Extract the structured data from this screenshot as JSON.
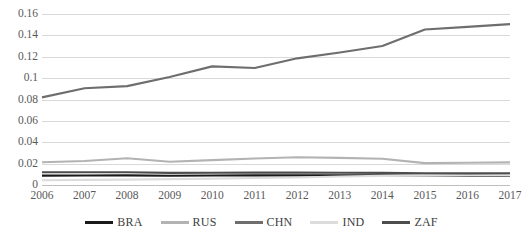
{
  "chart_data": {
    "type": "line",
    "title": "",
    "xlabel": "",
    "ylabel": "",
    "grid": true,
    "legend_position": "bottom",
    "categories": [
      2006,
      2007,
      2008,
      2009,
      2010,
      2011,
      2012,
      2013,
      2014,
      2015,
      2016,
      2017
    ],
    "x_tick_labels": [
      "2006",
      "2007",
      "2008",
      "2009",
      "2010",
      "2011",
      "2012",
      "2013",
      "2014",
      "2015",
      "2016",
      "2017"
    ],
    "y_tick_labels": [
      "0",
      "0.02",
      "0.04",
      "0.06",
      "0.08",
      "0.1",
      "0.12",
      "0.14",
      "0.16"
    ],
    "y_ticks": [
      0,
      0.02,
      0.04,
      0.06,
      0.08,
      0.1,
      0.12,
      0.14,
      0.16
    ],
    "ylim": [
      0,
      0.16
    ],
    "series": [
      {
        "name": "BRA",
        "color": "#1a1a1a",
        "values": [
          0.0088,
          0.0089,
          0.009,
          0.0086,
          0.0089,
          0.009,
          0.009,
          0.0091,
          0.009,
          0.0086,
          0.0085,
          0.0086
        ]
      },
      {
        "name": "RUS",
        "color": "#b3b3b3",
        "values": [
          0.0213,
          0.0224,
          0.025,
          0.0217,
          0.0233,
          0.0248,
          0.026,
          0.0254,
          0.0245,
          0.0205,
          0.0208,
          0.0212
        ]
      },
      {
        "name": "CHN",
        "color": "#6e6e6e",
        "values": [
          0.082,
          0.0905,
          0.0925,
          0.101,
          0.111,
          0.1095,
          0.1185,
          0.124,
          0.13,
          0.1455,
          0.148,
          0.1505
        ]
      },
      {
        "name": "IND",
        "color": "#dcdcdc",
        "values": [
          0.0045,
          0.0048,
          0.005,
          0.0055,
          0.006,
          0.0065,
          0.007,
          0.008,
          0.0085,
          0.0088,
          0.009,
          0.0091
        ]
      },
      {
        "name": "ZAF",
        "color": "#4d4d4d",
        "values": [
          0.012,
          0.0119,
          0.012,
          0.0113,
          0.0115,
          0.0116,
          0.0116,
          0.0114,
          0.0113,
          0.011,
          0.0109,
          0.011
        ]
      }
    ]
  }
}
